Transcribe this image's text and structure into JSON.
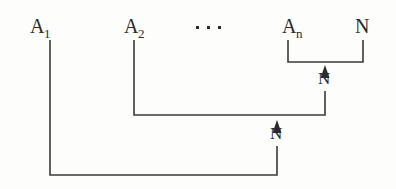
{
  "diagram": {
    "background_color": "#fdfdfb",
    "line_color": "#3a3a3a",
    "text_color": "#2b2b2b",
    "nodes": [
      {
        "id": "a1",
        "base": "A",
        "subscript": "1",
        "x": 30,
        "y": 33
      },
      {
        "id": "a2",
        "base": "A",
        "subscript": "2",
        "x": 124,
        "y": 33
      },
      {
        "id": "an",
        "base": "A",
        "subscript": "n",
        "x": 282,
        "y": 33
      },
      {
        "id": "n_top",
        "base": "N",
        "subscript": "",
        "x": 355,
        "y": 33
      }
    ],
    "ellipsis": {
      "label": "...",
      "x": 196,
      "y": 27,
      "dot_count": 3,
      "dot_spacing": 11,
      "dot_size": 3
    },
    "edge_labels": [
      {
        "id": "n-inner",
        "text": "N",
        "x": 318,
        "y": 84
      },
      {
        "id": "n-outer",
        "text": "N",
        "x": 270,
        "y": 139
      }
    ],
    "connectors": [
      {
        "id": "bracket-an-n",
        "description": "bracket joining A-n and N",
        "path": "M 288 40 L 288 62 L 363 62 L 363 40"
      },
      {
        "id": "connector-a2",
        "description": "A-2 down and across to first arrow",
        "path": "M 134 40 L 134 115 L 325 115 L 325 91"
      },
      {
        "id": "connector-a1",
        "description": "A-1 down and across to second arrow",
        "path": "M 50 40 L 50 175 L 277 175 L 277 146"
      }
    ],
    "arrows": [
      {
        "id": "arrow-inner",
        "tip_x": 325,
        "tip_y": 66,
        "width": 9,
        "height": 13
      },
      {
        "id": "arrow-outer",
        "tip_x": 277,
        "tip_y": 121,
        "width": 9,
        "height": 13
      }
    ]
  }
}
